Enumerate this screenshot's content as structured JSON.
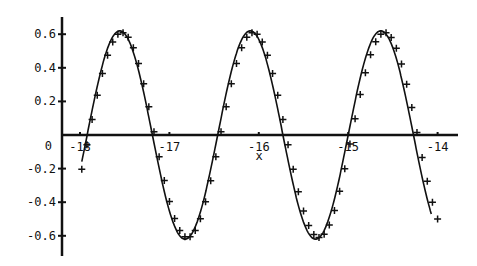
{
  "chart_data": {
    "type": "line",
    "title": "",
    "xlabel": "x",
    "ylabel": "",
    "xlim": [
      -18.2,
      -13.8
    ],
    "ylim": [
      -0.72,
      0.7
    ],
    "grid": false,
    "legend": null,
    "x_ticks": [
      -18,
      -17,
      -16,
      -15,
      -14
    ],
    "x_tick_labels": [
      "-18",
      "-17",
      "-16",
      "-15",
      "-14"
    ],
    "y_ticks": [
      0.6,
      0.4,
      0.2,
      0,
      -0.2,
      -0.4,
      -0.6
    ],
    "y_tick_labels": [
      "0.6",
      "0.4",
      "0.2",
      "0",
      "-0.2",
      "-0.4",
      "-0.6"
    ],
    "series": [
      {
        "name": "model curve",
        "style": "solid-line",
        "function": "0.62*sin(2*pi*(x+17.92)/1.46)",
        "x_range": [
          -17.98,
          -14.07
        ],
        "approx_points": [
          {
            "x": -17.98,
            "y": -0.49
          },
          {
            "x": -17.77,
            "y": 0.0
          },
          {
            "x": -17.55,
            "y": 0.6
          },
          {
            "x": -17.08,
            "y": 0.0
          },
          {
            "x": -16.77,
            "y": -0.6
          },
          {
            "x": -16.33,
            "y": 0.0
          },
          {
            "x": -16.0,
            "y": 0.6
          },
          {
            "x": -15.6,
            "y": 0.0
          },
          {
            "x": -15.27,
            "y": -0.6
          },
          {
            "x": -14.87,
            "y": 0.0
          },
          {
            "x": -14.5,
            "y": 0.62
          },
          {
            "x": -14.07,
            "y": 0.38
          }
        ]
      },
      {
        "name": "data points",
        "style": "plus-markers",
        "function": "0.61*sin(2*pi*(x+17.9)/1.47)",
        "x_range": [
          -17.98,
          -14.0
        ],
        "n_points": 70,
        "approx_points": [
          {
            "x": -17.98,
            "y": -0.31
          },
          {
            "x": -17.93,
            "y": -0.14
          },
          {
            "x": -17.85,
            "y": 0.1
          },
          {
            "x": -17.55,
            "y": 0.61
          },
          {
            "x": -17.2,
            "y": 0.2
          },
          {
            "x": -16.8,
            "y": -0.61
          },
          {
            "x": -16.35,
            "y": 0.05
          },
          {
            "x": -16.0,
            "y": 0.61
          },
          {
            "x": -15.6,
            "y": -0.05
          },
          {
            "x": -15.3,
            "y": -0.61
          },
          {
            "x": -14.85,
            "y": 0.05
          },
          {
            "x": -14.55,
            "y": 0.61
          },
          {
            "x": -14.2,
            "y": 0.3
          },
          {
            "x": -14.0,
            "y": 0.13
          }
        ]
      }
    ]
  },
  "axes": {
    "x_axis_label": "x",
    "origin_label": "0"
  }
}
